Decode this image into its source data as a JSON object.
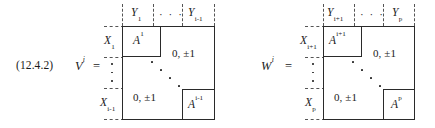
{
  "figure": {
    "equation_number": "(12.4.2)",
    "type": "block-matrix-diagram"
  },
  "matrices": [
    {
      "id": "V",
      "lhs": "V",
      "lhs_superscript": "i",
      "equals": "=",
      "column_labels": [
        {
          "base": "Y",
          "sub": "1"
        },
        {
          "base": "",
          "sub": "",
          "dots": "· · ·"
        },
        {
          "base": "Y",
          "sub": "i-1"
        }
      ],
      "row_labels": [
        {
          "base": "X",
          "sub": "1"
        },
        {
          "base": "",
          "sub": "",
          "dots": "vertical"
        },
        {
          "base": "X",
          "sub": "i-1"
        }
      ],
      "blocks": [
        {
          "label": "A",
          "sup": "1",
          "position": "top-left"
        },
        {
          "label": "A",
          "sup": "i-1",
          "position": "bottom-right"
        }
      ],
      "offdiagonal_upper": "0, ±1",
      "offdiagonal_lower": "0, ±1",
      "diagonal_dots": "⋱"
    },
    {
      "id": "W",
      "lhs": "W",
      "lhs_superscript": "i",
      "equals": "=",
      "column_labels": [
        {
          "base": "Y",
          "sub": "i+1"
        },
        {
          "base": "",
          "sub": "",
          "dots": "· · ·"
        },
        {
          "base": "Y",
          "sub": "p"
        }
      ],
      "row_labels": [
        {
          "base": "X",
          "sub": "i+1"
        },
        {
          "base": "",
          "sub": "",
          "dots": "vertical"
        },
        {
          "base": "X",
          "sub": "p"
        }
      ],
      "blocks": [
        {
          "label": "A",
          "sup": "i+1",
          "position": "top-left"
        },
        {
          "label": "A",
          "sup": "p",
          "position": "bottom-right"
        }
      ],
      "offdiagonal_upper": "0, ±1",
      "offdiagonal_lower": "0, ±1",
      "diagonal_dots": "⋱"
    }
  ],
  "colors": {
    "ink": "#1a1a1a",
    "frame": "#2a2a2a",
    "dashed_guide": "#555555",
    "background": "#ffffff"
  }
}
